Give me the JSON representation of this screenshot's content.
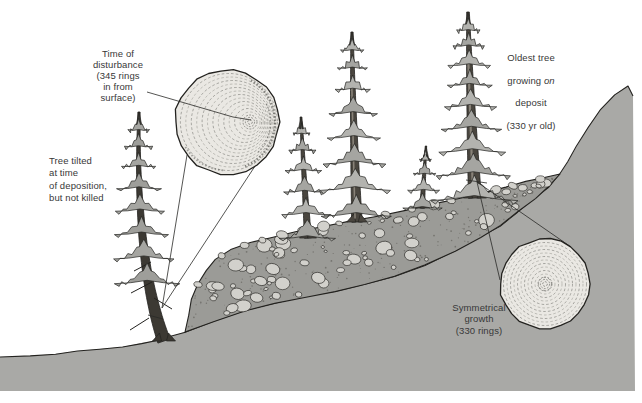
{
  "labels": {
    "disturbance": {
      "text": "Time of\ndisturbance\n(345 rings\nin from\nsurface)"
    },
    "tilted_tree": {
      "text": "Tree tilted\nat time\nof deposition,\nbut not killed"
    },
    "oldest_tree": {
      "line1": "Oldest tree",
      "line2_pre": "growing",
      "line2_italic": "on",
      "line3": "deposit",
      "line4": "(330 yr old)"
    },
    "symmetrical": {
      "text": "Symmetrical\ngrowth\n(330 rings)"
    }
  },
  "colors": {
    "background": "#ffffff",
    "ink_outline": "#23221f",
    "hillside_gray": "#a9a9a6",
    "deposit_gray": "#9b9b97",
    "boulder_gray": "#d2d1cc",
    "foliage_gray": "#b3b3af",
    "foliage_gray_dark": "#a5a5a1",
    "trunk_gray_brown": "#4a463f",
    "ring_face": "#eae8e3",
    "ring_line": "#7c7c77",
    "label_text": "#383838"
  }
}
